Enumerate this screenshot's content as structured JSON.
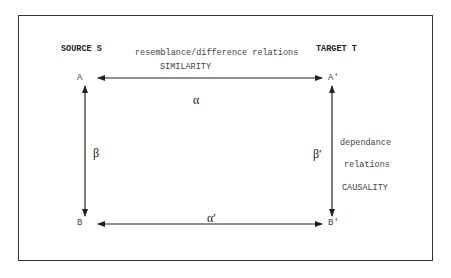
{
  "diagram": {
    "source_label": "SOURCE  S",
    "target_label": "TARGET  T",
    "top_relation": "resemblance/difference relations",
    "top_relation_type": "SIMILARITY",
    "side_relation_line1": "dependance",
    "side_relation_line2": "relations",
    "side_relation_type": "CAUSALITY",
    "nodes": {
      "a": "A",
      "a_prime": "A'",
      "b": "B",
      "b_prime": "B'"
    },
    "arrows": {
      "alpha": "α",
      "alpha_prime": "α′",
      "beta": "β",
      "beta_prime": "β′"
    }
  }
}
